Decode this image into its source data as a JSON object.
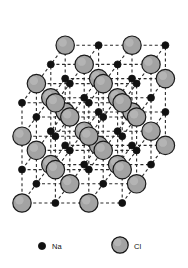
{
  "figure": {
    "background_color": "#ffffff",
    "width": 188,
    "height": 268
  },
  "legend": {
    "items": [
      {
        "key": "na",
        "label": "Na",
        "icon": "small-black-sphere",
        "color": "#111111",
        "stroke": "#111111",
        "radius": 3.6,
        "marker_cx": 42,
        "marker_cy": 246,
        "label_x": 52,
        "label_y": 249
      },
      {
        "key": "cl",
        "label": "Cl",
        "icon": "large-gray-sphere",
        "color": "#a3a3a3",
        "stroke": "#111111",
        "radius": 8.2,
        "marker_cx": 120,
        "marker_cy": 245,
        "label_x": 134,
        "label_y": 249
      }
    ]
  },
  "lattice": {
    "type": "rock-salt",
    "cells_per_edge": 3,
    "nodes_per_edge": 4,
    "projection": "oblique",
    "origin": {
      "x": 22,
      "y": 203
    },
    "step_x": {
      "x": 33.4,
      "y": 0
    },
    "step_y": {
      "x": 0,
      "y": -33.4
    },
    "step_z": {
      "x": 14.4,
      "y": -19.2
    },
    "parity_rule": "sum_even_is_cl",
    "bond_style": {
      "color": "#2b2b2b",
      "width": 1.1,
      "dash": "3,2.6"
    },
    "atoms": {
      "na": {
        "label": "Na",
        "fill": "#111111",
        "stroke": "#111111",
        "stroke_width": 0.8,
        "radius": 3.5
      },
      "cl": {
        "label": "Cl",
        "fill": "#a3a3a3",
        "stroke": "#1a1a1a",
        "stroke_width": 1.2,
        "radius": 9.2,
        "highlight": "#c2c2c2"
      }
    }
  },
  "chart_data": {
    "type": "diagram",
    "structure": "face-centred cubic rock-salt",
    "cells_per_edge": 3,
    "species": [
      {
        "symbol": "Na",
        "name": "Sodium",
        "marker": "small black sphere",
        "count": 32
      },
      {
        "symbol": "Cl",
        "name": "Chlorine",
        "marker": "large gray sphere",
        "count": 32
      }
    ],
    "legend_entries": [
      "Na",
      "Cl"
    ]
  }
}
